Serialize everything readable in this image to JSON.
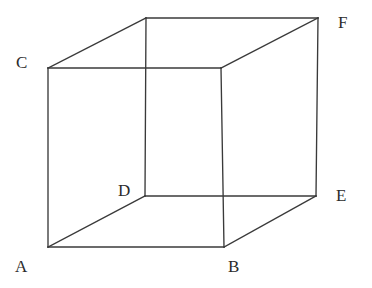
{
  "figure": {
    "type": "line-drawing",
    "background_color": "#ffffff",
    "stroke_color": "#3a3a3a",
    "label_color": "#2b2b2b",
    "canvas": {
      "width": 372,
      "height": 288
    },
    "labels": {
      "a": "A",
      "b": "B",
      "c": "C",
      "d": "D",
      "e": "E",
      "f": "F"
    },
    "vertices": {
      "A": {
        "x": 48,
        "y": 247
      },
      "B": {
        "x": 224,
        "y": 247
      },
      "C": {
        "x": 48,
        "y": 68
      },
      "D": {
        "x": 145,
        "y": 196
      },
      "E": {
        "x": 316,
        "y": 196
      },
      "F": {
        "x": 318,
        "y": 18
      },
      "G": {
        "x": 146,
        "y": 18
      },
      "H": {
        "x": 221,
        "y": 68
      }
    },
    "label_positions": {
      "A": {
        "x": 15,
        "y": 258
      },
      "B": {
        "x": 228,
        "y": 258
      },
      "C": {
        "x": 16,
        "y": 54
      },
      "D": {
        "x": 118,
        "y": 182
      },
      "E": {
        "x": 336,
        "y": 187
      },
      "F": {
        "x": 338,
        "y": 14
      }
    },
    "edges": [
      {
        "name": "A-B",
        "from": "A",
        "to": "B"
      },
      {
        "name": "A-C",
        "from": "A",
        "to": "C"
      },
      {
        "name": "A-D",
        "from": "A",
        "to": "D"
      },
      {
        "name": "B-E",
        "from": "B",
        "to": "E"
      },
      {
        "name": "B-H",
        "from": "B",
        "to": "H"
      },
      {
        "name": "C-G",
        "from": "C",
        "to": "G"
      },
      {
        "name": "C-H",
        "from": "C",
        "to": "H"
      },
      {
        "name": "D-E",
        "from": "D",
        "to": "E"
      },
      {
        "name": "D-G",
        "from": "D",
        "to": "G"
      },
      {
        "name": "E-F",
        "from": "E",
        "to": "F"
      },
      {
        "name": "F-G",
        "from": "F",
        "to": "G"
      },
      {
        "name": "F-H",
        "from": "F",
        "to": "H"
      }
    ]
  }
}
